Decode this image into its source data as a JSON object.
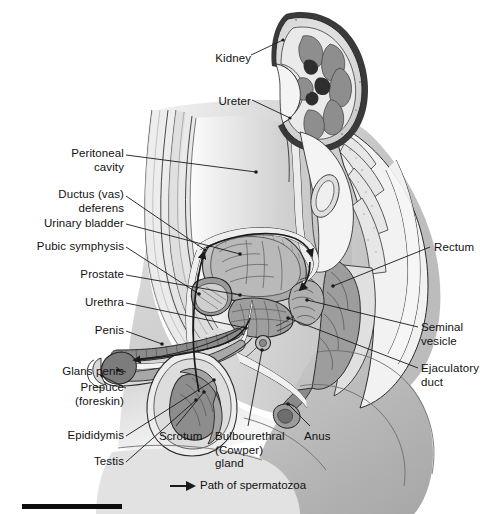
{
  "figure": {
    "orientation": "mid-sagittal view of male pelvis",
    "style": "grayscale medical illustration",
    "colors": {
      "background": "#ffffff",
      "line": "#1a1a1a",
      "label_text": "#111111",
      "tissue_light": "#e9e9e9",
      "tissue_mid": "#c7c7c7",
      "tissue_dark": "#9a9a9a",
      "organ_dark": "#7f7f7f",
      "organ_darkest": "#5e5e5e",
      "bar": "#0d0d0d"
    }
  },
  "labels": [
    {
      "id": "kidney",
      "text": "Kidney",
      "align": "right",
      "x": 205,
      "y": 52,
      "w": 56
    },
    {
      "id": "ureter",
      "text": "Ureter",
      "align": "right",
      "x": 205,
      "y": 95,
      "w": 56
    },
    {
      "id": "peritoneal-cavity",
      "text": "Peritoneal\ncavity",
      "align": "right",
      "x": 20,
      "y": 147,
      "w": 104
    },
    {
      "id": "ductus-deferens",
      "text": "Ductus (vas)\ndeferens",
      "align": "right",
      "x": 20,
      "y": 185,
      "w": 104
    },
    {
      "id": "urinary-bladder",
      "text": "Urinary bladder",
      "align": "right",
      "x": 10,
      "y": 218,
      "w": 114
    },
    {
      "id": "pubic-symphysis",
      "text": "Pubic symphysis",
      "align": "right",
      "x": 8,
      "y": 241,
      "w": 116
    },
    {
      "id": "prostate",
      "text": "Prostate",
      "align": "right",
      "x": 40,
      "y": 269,
      "w": 84
    },
    {
      "id": "urethra",
      "text": "Urethra",
      "align": "right",
      "x": 42,
      "y": 297,
      "w": 82
    },
    {
      "id": "penis",
      "text": "Penis",
      "align": "right",
      "x": 52,
      "y": 325,
      "w": 72
    },
    {
      "id": "glans-penis",
      "text": "Glans penis",
      "align": "right",
      "x": 22,
      "y": 366,
      "w": 102
    },
    {
      "id": "prepuce",
      "text": "Prepuce\n(foreskin)",
      "align": "right",
      "x": 22,
      "y": 382,
      "w": 102
    },
    {
      "id": "epididymis",
      "text": "Epididymis",
      "align": "right",
      "x": 24,
      "y": 430,
      "w": 100
    },
    {
      "id": "testis",
      "text": "Testis",
      "align": "right",
      "x": 62,
      "y": 456,
      "w": 62
    },
    {
      "id": "rectum",
      "text": "Rectum",
      "align": "left",
      "x": 434,
      "y": 243,
      "w": 60
    },
    {
      "id": "seminal-vesicle",
      "text": "Seminal\nvesicle",
      "align": "left",
      "x": 421,
      "y": 322,
      "w": 73
    },
    {
      "id": "ejaculatory-duct",
      "text": "Ejaculatory\nduct",
      "align": "left",
      "x": 421,
      "y": 364,
      "w": 73
    },
    {
      "id": "scrotum",
      "text": "Scrotum",
      "align": "left",
      "x": 159,
      "y": 431,
      "w": 62
    },
    {
      "id": "bulbourethral",
      "text": "Bulbourethral\n(Cowper)\ngland",
      "align": "left",
      "x": 215,
      "y": 431,
      "w": 86
    },
    {
      "id": "anus",
      "text": "Anus",
      "align": "left",
      "x": 304,
      "y": 431,
      "w": 40
    }
  ],
  "legend": {
    "arrow_icon": "right-arrow-icon",
    "text": "Path of spermatozoa",
    "x": 168,
    "y": 480
  },
  "footer": {
    "bar_label": "black-rule",
    "x": 22,
    "y": 504,
    "w": 100,
    "h": 5
  }
}
